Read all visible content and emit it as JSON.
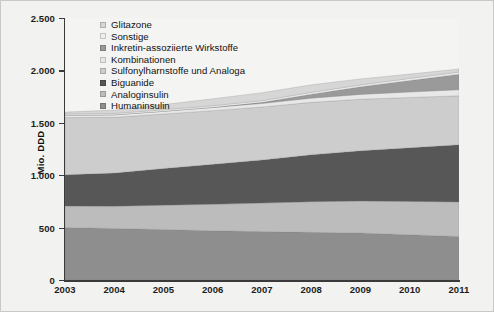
{
  "chart_data": {
    "type": "area",
    "stacked": true,
    "title": "",
    "subtitle": "",
    "xlabel": "",
    "ylabel": "Mio. DDD",
    "x": [
      2003,
      2004,
      2005,
      2006,
      2007,
      2008,
      2009,
      2010,
      2011
    ],
    "categories": [
      "2003",
      "2004",
      "2005",
      "2006",
      "2007",
      "2008",
      "2009",
      "2010",
      "2011"
    ],
    "ylim": [
      0,
      2500
    ],
    "ytick_values": [
      0,
      500,
      1000,
      1500,
      2000,
      2500
    ],
    "ytick_labels": [
      "0",
      "500",
      "1.000",
      "1.500",
      "2.000",
      "2.500"
    ],
    "grid": false,
    "legend_position": "top-left-inside",
    "series": [
      {
        "name": "Humaninsulin",
        "color": "#8e8e8e",
        "values": [
          500,
          492,
          482,
          470,
          462,
          455,
          448,
          432,
          415
        ]
      },
      {
        "name": "Analoginsulin",
        "color": "#bcbcbc",
        "values": [
          205,
          212,
          232,
          252,
          272,
          292,
          305,
          318,
          330
        ]
      },
      {
        "name": "Biguanide",
        "color": "#575757",
        "values": [
          300,
          316,
          350,
          382,
          412,
          448,
          480,
          512,
          545
        ]
      },
      {
        "name": "Sulfonylharnstoffe und Analoga",
        "color": "#cdcdcd",
        "values": [
          545,
          532,
          520,
          512,
          505,
          500,
          492,
          480,
          468
        ]
      },
      {
        "name": "Kombinationen",
        "color": "#e8e8e8",
        "values": [
          22,
          24,
          26,
          30,
          34,
          40,
          46,
          52,
          58
        ]
      },
      {
        "name": "Inkretin-assoziierte Wirkstoffe",
        "color": "#9a9a9a",
        "values": [
          0,
          0,
          0,
          2,
          10,
          38,
          72,
          110,
          148
        ]
      },
      {
        "name": "Sonstige",
        "color": "#efefef",
        "values": [
          12,
          13,
          14,
          15,
          16,
          17,
          18,
          19,
          20
        ]
      },
      {
        "name": "Glitazone",
        "color": "#d6d6d6",
        "values": [
          18,
          32,
          50,
          66,
          76,
          72,
          58,
          42,
          30
        ]
      }
    ],
    "totals": [
      1602,
      1621,
      1674,
      1729,
      1787,
      1862,
      1919,
      1965,
      2014
    ]
  },
  "legend": {
    "items": [
      {
        "label": "Glitazone",
        "color": "#d6d6d6"
      },
      {
        "label": "Sonstige",
        "color": "#efefef"
      },
      {
        "label": "Inkretin-assoziierte Wirkstoffe",
        "color": "#9a9a9a"
      },
      {
        "label": "Kombinationen",
        "color": "#e8e8e8"
      },
      {
        "label": "Sulfonylharnstoffe und Analoga",
        "color": "#cdcdcd"
      },
      {
        "label": "Biguanide",
        "color": "#575757"
      },
      {
        "label": "Analoginsulin",
        "color": "#bcbcbc"
      },
      {
        "label": "Humaninsulin",
        "color": "#8e8e8e"
      }
    ]
  },
  "axes": {
    "y_title": "Mio. DDD",
    "y_labels": [
      "2.500",
      "2.000",
      "1.500",
      "1.000",
      "500",
      "0"
    ],
    "x_labels": [
      "2003",
      "2004",
      "2005",
      "2006",
      "2007",
      "2008",
      "2009",
      "2010",
      "2011"
    ]
  }
}
